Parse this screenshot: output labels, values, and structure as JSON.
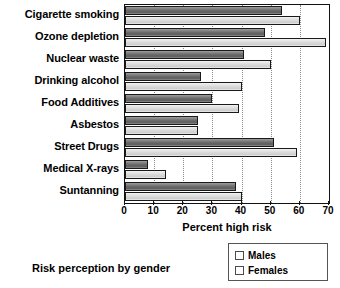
{
  "chart_data": {
    "type": "bar",
    "orientation": "horizontal",
    "title": "",
    "caption": "Risk perception by gender",
    "xlabel": "Percent high risk",
    "ylabel": "",
    "xlim": [
      0,
      70
    ],
    "xticks": [
      0,
      10,
      20,
      30,
      40,
      50,
      60,
      70
    ],
    "xtick_labels": [
      "0",
      "10",
      "20",
      "30",
      "40",
      "50",
      "60",
      "70"
    ],
    "grid": "vertical-dotted",
    "legend_position": "bottom-right",
    "categories": [
      "Cigarette smoking",
      "Ozone depletion",
      "Nuclear waste",
      "Drinking alcohol",
      "Food Additives",
      "Asbestos",
      "Street Drugs",
      "Medical X-rays",
      "Suntanning"
    ],
    "series": [
      {
        "name": "Males",
        "color": "#6e6e6e",
        "values": [
          54,
          48,
          41,
          26,
          30,
          25,
          51,
          8,
          38
        ]
      },
      {
        "name": "Females",
        "color": "#dcdcdc",
        "values": [
          60,
          69,
          50,
          40,
          39,
          25,
          59,
          14,
          40
        ]
      }
    ]
  },
  "legend": {
    "items": [
      {
        "label": "Males",
        "swatch": "male"
      },
      {
        "label": "Females",
        "swatch": "female"
      }
    ]
  }
}
